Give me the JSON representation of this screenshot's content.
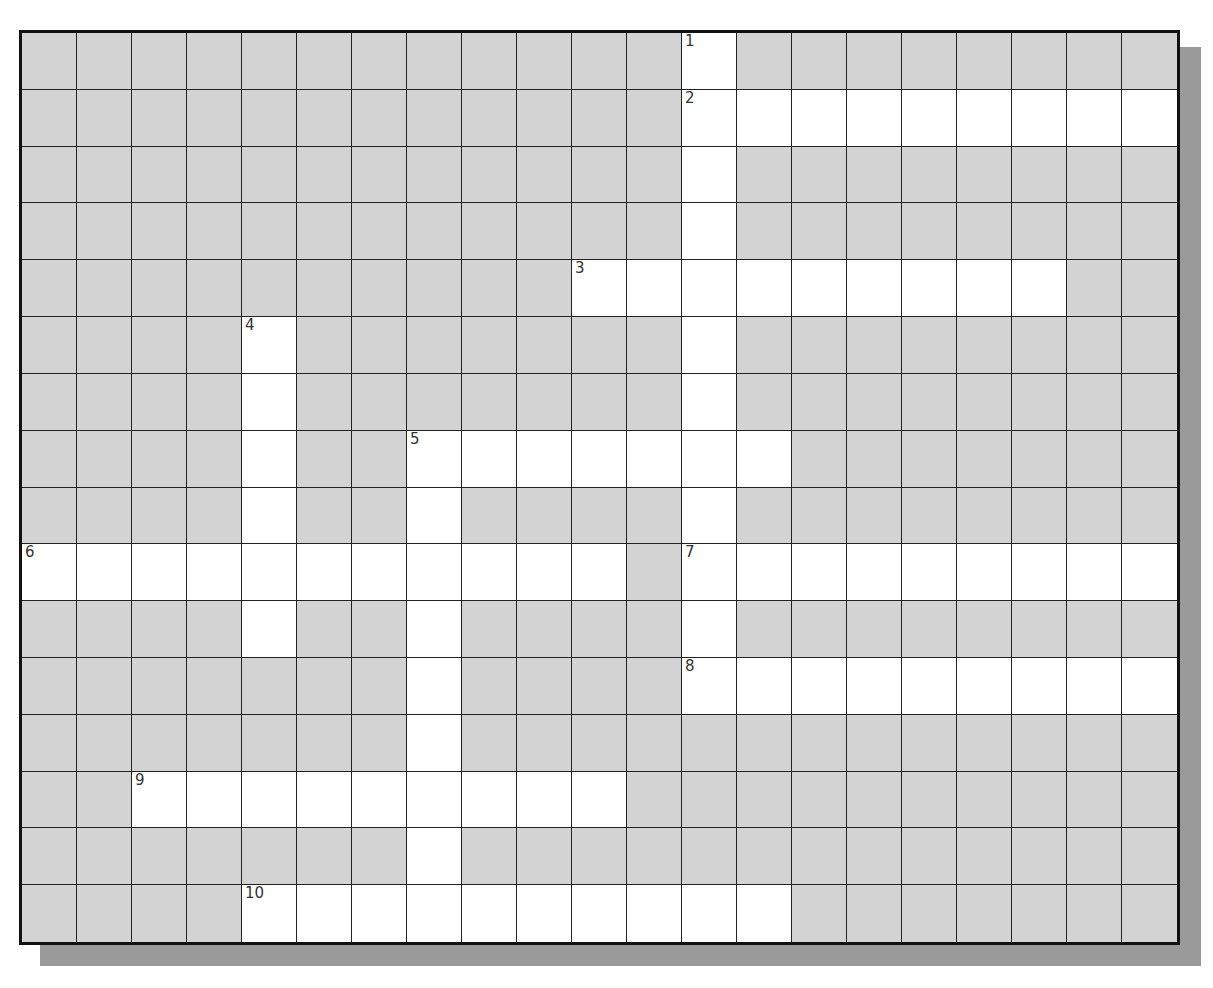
{
  "puzzle": {
    "rows": 16,
    "cols": 21,
    "colors": {
      "block": "#d3d3d3",
      "open": "#ffffff",
      "grid": "#222222",
      "shadow": "#9a9a9a"
    },
    "entries": [
      {
        "number": "1",
        "direction": "down",
        "row": 0,
        "col": 12,
        "length": 12
      },
      {
        "number": "2",
        "direction": "across",
        "row": 1,
        "col": 12,
        "length": 9
      },
      {
        "number": "3",
        "direction": "across",
        "row": 4,
        "col": 10,
        "length": 9
      },
      {
        "number": "4",
        "direction": "down",
        "row": 5,
        "col": 4,
        "length": 6
      },
      {
        "number": "5",
        "direction": "across",
        "row": 7,
        "col": 7,
        "length": 7
      },
      {
        "number": "5",
        "direction": "down",
        "row": 7,
        "col": 7,
        "length": 9
      },
      {
        "number": "6",
        "direction": "across",
        "row": 9,
        "col": 0,
        "length": 11
      },
      {
        "number": "7",
        "direction": "across",
        "row": 9,
        "col": 12,
        "length": 9
      },
      {
        "number": "8",
        "direction": "across",
        "row": 11,
        "col": 12,
        "length": 9
      },
      {
        "number": "9",
        "direction": "across",
        "row": 13,
        "col": 2,
        "length": 9
      },
      {
        "number": "10",
        "direction": "across",
        "row": 15,
        "col": 4,
        "length": 10
      }
    ]
  }
}
